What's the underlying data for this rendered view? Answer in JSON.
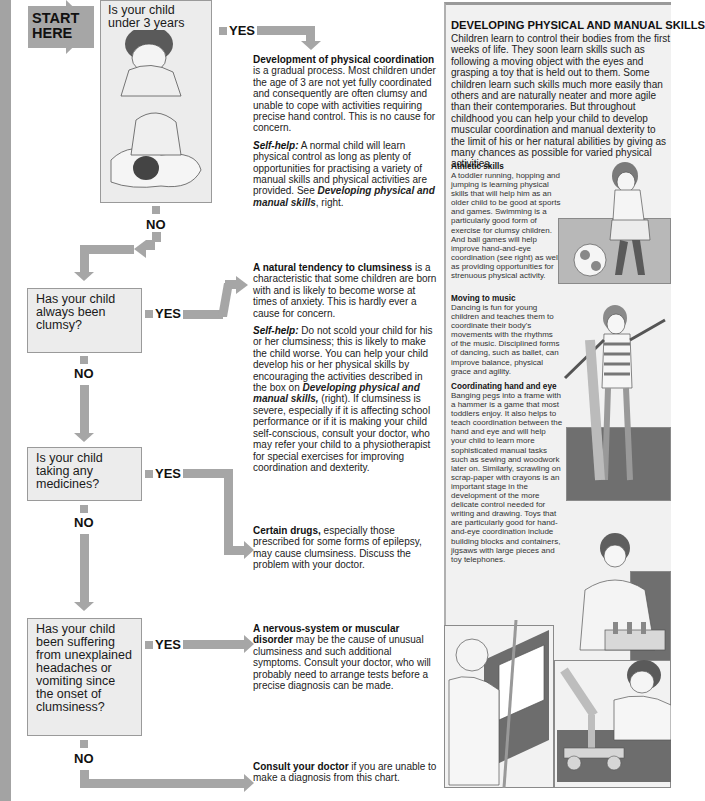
{
  "flowchart": {
    "start_label": "START\nHERE",
    "yes_label": "YES",
    "no_label": "NO",
    "questions": [
      {
        "text": "Is your child under 3 years old?"
      },
      {
        "text": "Has your child always been clumsy?"
      },
      {
        "text": "Is your child taking any medicines?"
      },
      {
        "text": "Has your child been suffering from unexplained headaches or vomiting since the onset of clumsiness?"
      }
    ],
    "answers": [
      {
        "title": "Development of physical coordination",
        "body": " is a gradual process. Most children under the age of 3 are not yet fully coordinated and consequently are often clumsy and unable to cope with activities requiring precise hand control. This is no cause for concern.",
        "selfhelp_label": "Self-help:",
        "selfhelp_body": " A normal child will learn physical control as long as plenty of opportunities for practising a variety of manual skills and physical activities are provided. See ",
        "selfhelp_ref": "Developing physical and manual skills",
        "selfhelp_tail": ", right."
      },
      {
        "title": "A natural tendency to clumsiness",
        "body": " is a characteristic that some children are born with and is likely to become worse at times of anxiety. This is hardly ever a cause for concern.",
        "selfhelp_label": "Self-help:",
        "selfhelp_body": " Do not scold your child for his or her clumsiness; this is likely to make the child worse. You can help your child develop his or her physical skills by encouraging the activities described in the box on ",
        "selfhelp_ref": "Developing physical and manual skills,",
        "selfhelp_tail": " (right). If clumsiness is severe, especially if it is affecting school performance or if it is making your child self-conscious, consult your doctor, who may refer your child to a physiotherapist for special exercises for improving coordination and dexterity."
      },
      {
        "title": "Certain drugs,",
        "body": " especially those prescribed for some forms of epilepsy, may cause clumsiness. Discuss the problem with your doctor."
      },
      {
        "title": "A nervous-system or muscular disorder",
        "body": " may be the cause of unusual clumsiness and such additional symptoms. Consult your doctor, who will probably need to arrange tests before a precise diagnosis can be made."
      },
      {
        "title": "Consult your doctor",
        "body": " if you are unable to make a diagnosis from this chart."
      }
    ]
  },
  "panel": {
    "title": "DEVELOPING PHYSICAL AND MANUAL SKILLS",
    "intro": "Children learn to control their bodies from the first weeks of life. They soon learn skills such as following a moving object with the eyes and grasping a toy that is held out to them. Some children learn such skills much more easily than others and are naturally neater and more agile than their contemporaries. But throughout childhood you can help your child to develop muscular coordination and manual dexterity to the limit of his or her natural abilities by giving as many chances as possible for varied physical activities.",
    "sections": [
      {
        "heading": "Athletic skills",
        "body": "A toddler running, hopping and jumping is learning physical skills that will help him as an older child to be good at sports and games. Swimming is a particularly good form of exercise for clumsy children. And ball games will help improve hand-and-eye coordination (see right) as well as providing opportunities for strenuous physical activity."
      },
      {
        "heading": "Moving to music",
        "body": "Dancing is fun for young children and teaches them to coordinate their body's movements with the rhythms of the music. Disciplined forms of dancing, such as ballet, can improve balance, physical grace and agility."
      },
      {
        "heading": "Coordinating hand and eye",
        "body": "Banging pegs into a frame with a hammer is a game that most toddlers enjoy. It also helps to teach coordination between the hand and eye and will help your child to learn more sophisticated manual tasks such as sewing and woodwork later on. Similarly, scrawling on scrap-paper with crayons is an important stage in the development of the more delicate control needed for writing and drawing. Toys that are particularly good for hand-and-eye coordination include building blocks and containers, jigsaws with large pieces and toy telephones."
      }
    ]
  }
}
